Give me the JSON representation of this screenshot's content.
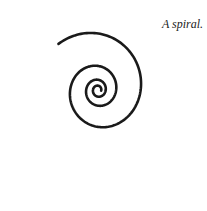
{
  "caption": "A spiral.",
  "colors": {
    "stroke": "#1a1a1a",
    "background": "#ffffff"
  },
  "spiral": {
    "type": "logarithmic",
    "direction": "counter-clockwise-outward",
    "turns": 3.4
  }
}
